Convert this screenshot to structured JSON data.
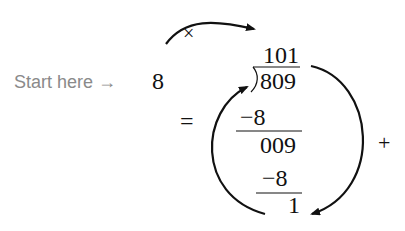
{
  "diagram": {
    "start_label": "Start here →",
    "divisor": "8",
    "quotient": "101",
    "dividend": "809",
    "step1_subtract": "−8",
    "step1_result": "009",
    "step2_subtract": "−8",
    "remainder": "1",
    "multiply_symbol": "×",
    "equals_symbol": "=",
    "plus_symbol": "+"
  }
}
